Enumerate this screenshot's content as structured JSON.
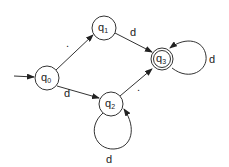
{
  "diagram": {
    "type": "finite-automaton",
    "states": [
      {
        "id": "q0",
        "label": "q",
        "subscript": "0",
        "initial": true,
        "accepting": false
      },
      {
        "id": "q1",
        "label": "q",
        "subscript": "1",
        "initial": false,
        "accepting": false
      },
      {
        "id": "q2",
        "label": "q",
        "subscript": "2",
        "initial": false,
        "accepting": false
      },
      {
        "id": "q3",
        "label": "q",
        "subscript": "3",
        "initial": false,
        "accepting": true
      }
    ],
    "transitions": [
      {
        "from": "q0",
        "to": "q1",
        "label": "."
      },
      {
        "from": "q0",
        "to": "q2",
        "label": "d"
      },
      {
        "from": "q1",
        "to": "q3",
        "label": "d"
      },
      {
        "from": "q2",
        "to": "q3",
        "label": "."
      },
      {
        "from": "q2",
        "to": "q2",
        "label": "d"
      },
      {
        "from": "q3",
        "to": "q3",
        "label": "d"
      }
    ]
  }
}
